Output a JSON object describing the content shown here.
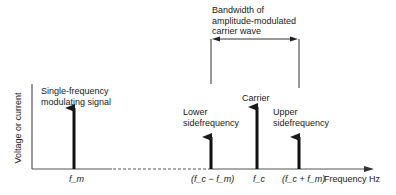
{
  "diagram": {
    "y_axis_label": "Voltage or current",
    "x_axis_label": "Frequency Hz",
    "bandwidth_label_lines": [
      "Bandwidth of",
      "amplitude-modulated",
      "carrier wave"
    ],
    "components": [
      {
        "name": "modulating-signal",
        "label_lines": [
          "Single-frequency",
          "modulating signal"
        ],
        "tick": "f_m",
        "relative_height": "tall"
      },
      {
        "name": "lower-sidefrequency",
        "label_lines": [
          "Lower",
          "sidefrequency"
        ],
        "tick": "(f_c − f_m)",
        "relative_height": "short"
      },
      {
        "name": "carrier",
        "label_lines": [
          "Carrier"
        ],
        "tick": "f_c",
        "relative_height": "tall"
      },
      {
        "name": "upper-sidefrequency",
        "label_lines": [
          "Upper",
          "sidefrequency"
        ],
        "tick": "(f_c + f_m)",
        "relative_height": "short"
      }
    ],
    "colors": {
      "line": "#1a1a1a",
      "background": "#ffffff",
      "axis": "#555555"
    }
  }
}
